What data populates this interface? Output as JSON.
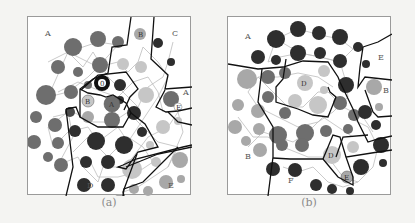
{
  "figure": {
    "panels": [
      {
        "id": "a",
        "caption": "(a)",
        "region_labels": [
          {
            "text": "A",
            "x": 17,
            "y": 19
          },
          {
            "text": "C",
            "x": 144,
            "y": 19
          },
          {
            "text": "A",
            "x": 153,
            "y": 75
          },
          {
            "text": "D",
            "x": 59,
            "y": 171
          },
          {
            "text": "E",
            "x": 140,
            "y": 171
          }
        ],
        "node_labels": [
          {
            "text": "B",
            "x": 112,
            "y": 17
          },
          {
            "text": "0",
            "x": 73,
            "y": 65
          },
          {
            "text": "B",
            "x": 60,
            "y": 83
          },
          {
            "text": "A",
            "x": 84,
            "y": 87
          },
          {
            "text": "E",
            "x": 150,
            "y": 90
          }
        ]
      },
      {
        "id": "b",
        "caption": "(b)",
        "region_labels": [
          {
            "text": "A",
            "x": 17,
            "y": 22
          },
          {
            "text": "E",
            "x": 154,
            "y": 43
          },
          {
            "text": "B",
            "x": 156,
            "y": 74
          },
          {
            "text": "B",
            "x": 17,
            "y": 142
          },
          {
            "text": "F",
            "x": 60,
            "y": 166
          }
        ],
        "node_labels": [
          {
            "text": "D",
            "x": 76,
            "y": 66
          },
          {
            "text": "D",
            "x": 104,
            "y": 138
          },
          {
            "text": "E",
            "x": 119,
            "y": 160
          }
        ]
      }
    ],
    "colors": {
      "dark": "#2e2e2e",
      "mid_dark": "#4a4a4a",
      "mid": "#6e6e6e",
      "light": "#a8a8a8",
      "lighter": "#c6c6c6",
      "edge": "#b8b8b8",
      "boundary": "#111111"
    }
  }
}
